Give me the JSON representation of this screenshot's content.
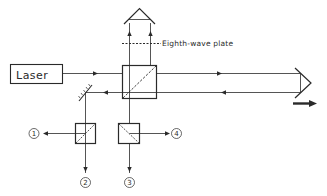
{
  "diagram": {
    "type": "optical-interferometer",
    "colors": {
      "stroke": "#2a2a2a",
      "background": "#ffffff"
    },
    "components": {
      "laser": {
        "label": "Laser"
      },
      "wave_plate": {
        "label": "Eighth-wave plate"
      },
      "main_beam_splitter": {
        "label": ""
      },
      "roof_prism": {
        "label": ""
      },
      "corner_cube": {
        "label": ""
      },
      "fold_mirror": {
        "label": ""
      },
      "polarizing_splitter_left": {
        "label": ""
      },
      "polarizing_splitter_right": {
        "label": ""
      },
      "motion_arrow": {
        "label": ""
      }
    },
    "detectors": [
      {
        "id": "1",
        "label": "1"
      },
      {
        "id": "2",
        "label": "2"
      },
      {
        "id": "3",
        "label": "3"
      },
      {
        "id": "4",
        "label": "4"
      }
    ]
  }
}
